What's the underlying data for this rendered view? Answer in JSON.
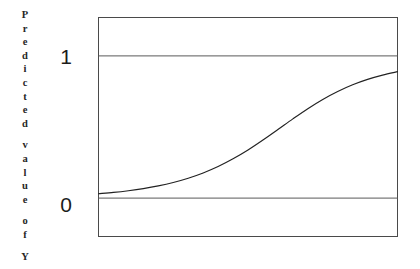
{
  "figure": {
    "title": "",
    "y_axis_label_text": "Predicted value of Y",
    "y_axis_label_letters": [
      "P",
      "r",
      "e",
      "d",
      "i",
      "c",
      "t",
      "e",
      "d",
      "",
      "v",
      "a",
      "l",
      "u",
      "e",
      "",
      "o",
      "f",
      "",
      "Y"
    ],
    "tick_labels": {
      "upper": "1",
      "lower": "0"
    },
    "colors": {
      "background": "#ffffff",
      "frame": "#4a4a4a",
      "reference_line": "#5a5a5a",
      "curve": "#222222",
      "text": "#1c1c1c"
    }
  },
  "chart_data": {
    "type": "line",
    "title": "",
    "xlabel": "",
    "ylabel": "Predicted value of Y",
    "xlim": [
      0,
      1
    ],
    "ylim": [
      -0.27,
      1.27
    ],
    "grid": false,
    "legend": null,
    "y_tick_values": [
      0,
      1
    ],
    "y_tick_labels": [
      "0",
      "1"
    ],
    "x_tick_values": [],
    "x_tick_labels": [],
    "reference_lines": [
      {
        "name": "y-equals-one",
        "y": 1
      },
      {
        "name": "y-equals-zero",
        "y": 0
      }
    ],
    "series": [
      {
        "name": "logistic-curve",
        "x": [
          0.0,
          0.05,
          0.1,
          0.15,
          0.2,
          0.25,
          0.3,
          0.35,
          0.4,
          0.45,
          0.5,
          0.55,
          0.6,
          0.65,
          0.7,
          0.75,
          0.8,
          0.85,
          0.9,
          0.95,
          1.0
        ],
        "y": [
          0.031,
          0.04,
          0.052,
          0.067,
          0.086,
          0.11,
          0.14,
          0.177,
          0.222,
          0.276,
          0.338,
          0.408,
          0.482,
          0.557,
          0.629,
          0.694,
          0.75,
          0.797,
          0.835,
          0.865,
          0.889
        ]
      }
    ]
  }
}
